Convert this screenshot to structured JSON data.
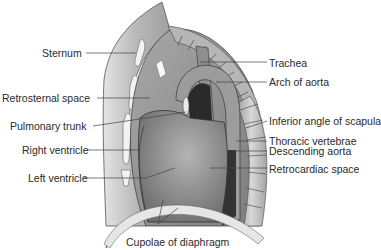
{
  "diagram": {
    "labels_left": [
      {
        "text": "Sternum",
        "x": 42,
        "y": 47
      },
      {
        "text": "Retrosternal space",
        "x": 2,
        "y": 92
      },
      {
        "text": "Pulmonary trunk",
        "x": 10,
        "y": 120
      },
      {
        "text": "Right ventricle",
        "x": 22,
        "y": 144
      },
      {
        "text": "Left ventricle",
        "x": 28,
        "y": 172
      }
    ],
    "labels_right": [
      {
        "text": "Trachea",
        "x": 269,
        "y": 57
      },
      {
        "text": "Arch of aorta",
        "x": 269,
        "y": 76
      },
      {
        "text": "Inferior angle of scapula",
        "x": 269,
        "y": 115
      },
      {
        "text": "Thoracic vertebrae",
        "x": 269,
        "y": 135
      },
      {
        "text": "Descending aorta",
        "x": 269,
        "y": 145
      },
      {
        "text": "Retrocardiac space",
        "x": 269,
        "y": 163
      }
    ],
    "labels_bottom": [
      {
        "text": "Cupolae of diaphragm",
        "x": 126,
        "y": 236
      }
    ],
    "colors": {
      "label_text": "#2a2a2a",
      "leader_line": "#444444",
      "chest_wall": "#c4c4c4",
      "heart": "#8a8a8a",
      "spine": "#b0b0b0",
      "dark_space": "#2c2c2c"
    }
  }
}
